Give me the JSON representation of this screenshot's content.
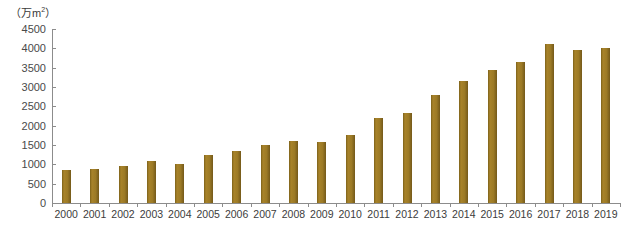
{
  "chart_data": {
    "type": "bar",
    "title": "",
    "subtitle": "",
    "xlabel": "",
    "ylabel": "",
    "unit_label": "（万m²）",
    "unit_prefix": "（万m",
    "unit_exponent": "2",
    "unit_suffix": "）",
    "categories": [
      "2000",
      "2001",
      "2002",
      "2003",
      "2004",
      "2005",
      "2006",
      "2007",
      "2008",
      "2009",
      "2010",
      "2011",
      "2012",
      "2013",
      "2014",
      "2015",
      "2016",
      "2017",
      "2018",
      "2019"
    ],
    "values": [
      850,
      880,
      960,
      1080,
      1020,
      1250,
      1350,
      1500,
      1600,
      1580,
      1750,
      2200,
      2320,
      2800,
      3150,
      3450,
      3650,
      4100,
      3950,
      4000
    ],
    "ylim": [
      0,
      4500
    ],
    "yticks": [
      0,
      500,
      1000,
      1500,
      2000,
      2500,
      3000,
      3500,
      4000,
      4500
    ],
    "ytick_labels": [
      "0",
      "500",
      "1000",
      "1500",
      "2000",
      "2500",
      "3000",
      "3500",
      "4000",
      "4500"
    ],
    "grid": false,
    "legend": null,
    "series_color": "#9c7a26",
    "axis_color": "#8c8c8c",
    "text_color": "#3c3c3c"
  }
}
